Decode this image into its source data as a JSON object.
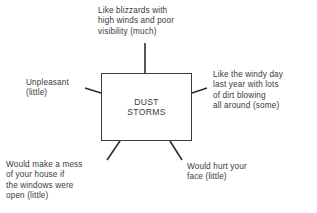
{
  "diagram": {
    "type": "concept-map",
    "center": {
      "lines": [
        "DUST",
        "STORMS"
      ]
    },
    "attributes": [
      {
        "id": "top",
        "position": "top",
        "lines": [
          "Like blizzards with",
          "high winds and poor",
          "visibility (much)"
        ],
        "degree": "much"
      },
      {
        "id": "left",
        "position": "left",
        "lines": [
          "Unpleasant",
          "(little)"
        ],
        "degree": "little"
      },
      {
        "id": "right",
        "position": "right",
        "lines": [
          "Like the windy day",
          "last year with lots",
          "of dirt blowing",
          "all around (some)"
        ],
        "degree": "some"
      },
      {
        "id": "bottom-left",
        "position": "bottom-left",
        "lines": [
          "Would make a mess",
          "of your house if",
          "the windows were",
          "open (little)"
        ],
        "degree": "little"
      },
      {
        "id": "bottom-right",
        "position": "bottom-right",
        "lines": [
          "Would hurt your",
          "face (little)"
        ],
        "degree": "little"
      }
    ],
    "colors": {
      "ink": "#3a3a3a",
      "background": "#ffffff"
    }
  }
}
